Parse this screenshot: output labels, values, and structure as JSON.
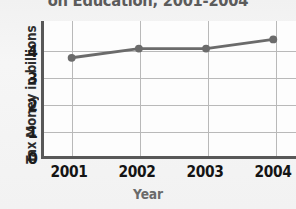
{
  "chart_data": {
    "type": "line",
    "title": "on Education, 2001-2004",
    "title_note": "title is cropped by the top edge of the screenshot",
    "xlabel": "Year",
    "ylabel": "Tax Money in billions",
    "categories": [
      "2001",
      "2002",
      "2003",
      "2004"
    ],
    "values": [
      3.2,
      3.5,
      3.5,
      3.8
    ],
    "x": [
      2001,
      2002,
      2003,
      2004
    ],
    "ylim": [
      0,
      4.4
    ],
    "yticks": [
      "4",
      "3",
      "2",
      "1",
      "0"
    ],
    "ytick_values": [
      4,
      3,
      2,
      1,
      0
    ],
    "xticks": [
      "2001",
      "2002",
      "2003",
      "2004"
    ],
    "grid": true,
    "legend": "none",
    "series": [
      {
        "name": "Tax Money in billions",
        "values": [
          3.2,
          3.5,
          3.5,
          3.8
        ]
      }
    ],
    "colors": {
      "line": "#6b6b6b",
      "marker": "#6b6b6b",
      "axis": "#585858",
      "grid": "#b9b9b9",
      "plot_background": "#fdfdfd",
      "figure_background": "#f2f2f2",
      "tick_text": "#141414",
      "ylabel_text": "#2e2e2e",
      "xlabel_text": "#6a6a6a",
      "title_text": "#5b5b5b"
    }
  }
}
